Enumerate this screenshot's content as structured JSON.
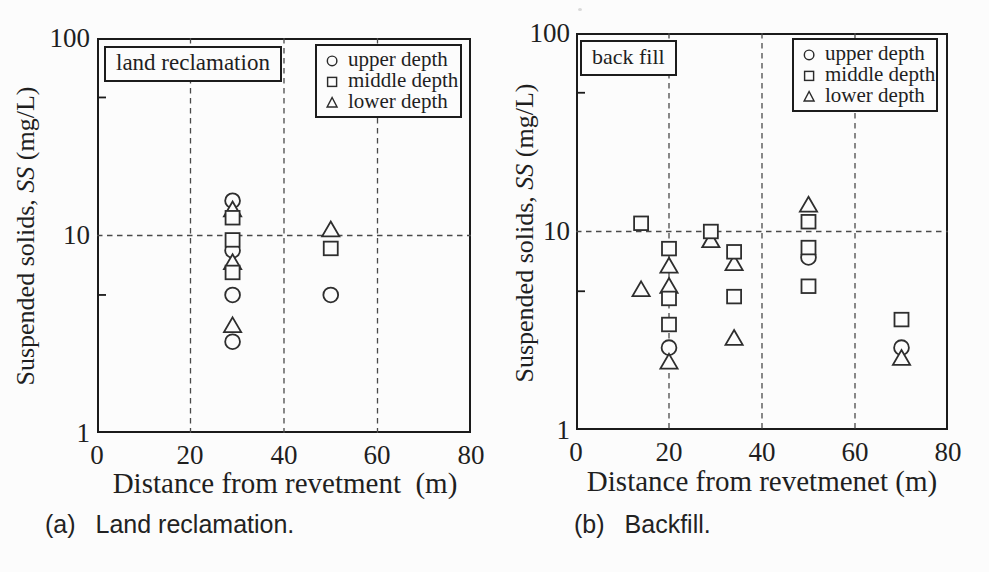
{
  "figure": {
    "ylabel_prefix": "Suspended solids, ",
    "ylabel_ss": "SS",
    "ylabel_unit": " (mg/L)"
  },
  "chart_data": [
    {
      "type": "scatter",
      "panel_label": "(a)",
      "panel_caption": "Land reclamation.",
      "title": "land reclamation",
      "xlabel": "Distance from revetment  (m)",
      "ylabel": "Suspended solids, SS (mg/L)",
      "x_axis": {
        "min": 0,
        "max": 80,
        "ticks": [
          "0",
          "20",
          "40",
          "60",
          "80"
        ],
        "tick_values": [
          0,
          20,
          40,
          60,
          80
        ]
      },
      "y_axis": {
        "scale": "log",
        "min": 1,
        "max": 100,
        "ticks": [
          "100",
          "10",
          "1"
        ],
        "tick_values": [
          100,
          10,
          1
        ],
        "minor_ticks": [
          50,
          5
        ]
      },
      "grid": {
        "x_dashed": [
          20,
          40,
          60
        ],
        "y_dashed": [
          10
        ]
      },
      "legend": [
        {
          "marker": "circle",
          "label": "upper depth"
        },
        {
          "marker": "square",
          "label": "middle depth"
        },
        {
          "marker": "triangle",
          "label": "lower depth"
        }
      ],
      "series": [
        {
          "name": "upper depth",
          "marker": "circle",
          "points": [
            [
              29,
              15.0
            ],
            [
              29,
              8.4
            ],
            [
              29,
              5.0
            ],
            [
              29,
              2.9
            ],
            [
              50,
              5.0
            ]
          ]
        },
        {
          "name": "middle depth",
          "marker": "square",
          "points": [
            [
              29,
              12.3
            ],
            [
              29,
              9.5
            ],
            [
              29,
              6.5
            ],
            [
              50,
              8.6
            ]
          ]
        },
        {
          "name": "lower depth",
          "marker": "triangle",
          "points": [
            [
              29,
              13.5
            ],
            [
              29,
              7.3
            ],
            [
              29,
              3.5
            ],
            [
              50,
              10.7
            ]
          ]
        }
      ]
    },
    {
      "type": "scatter",
      "panel_label": "(b)",
      "panel_caption": "Backfill.",
      "title": "back fill",
      "xlabel": "Distance from revetmenet (m)",
      "ylabel": "Suspended solids, SS (mg/L)",
      "x_axis": {
        "min": 0,
        "max": 80,
        "ticks": [
          "0",
          "20",
          "40",
          "60",
          "80"
        ],
        "tick_values": [
          0,
          20,
          40,
          60,
          80
        ]
      },
      "y_axis": {
        "scale": "log",
        "min": 1,
        "max": 100,
        "ticks": [
          "100",
          "10",
          "1"
        ],
        "tick_values": [
          100,
          10,
          1
        ],
        "minor_ticks": [
          50,
          5
        ]
      },
      "grid": {
        "x_dashed": [
          20,
          40,
          60
        ],
        "y_dashed": [
          10
        ]
      },
      "legend": [
        {
          "marker": "circle",
          "label": "upper depth"
        },
        {
          "marker": "square",
          "label": "middle depth"
        },
        {
          "marker": "triangle",
          "label": "lower depth"
        }
      ],
      "series": [
        {
          "name": "upper depth",
          "marker": "circle",
          "points": [
            [
              20,
              2.6
            ],
            [
              50,
              7.4
            ],
            [
              70,
              2.6
            ]
          ]
        },
        {
          "name": "middle depth",
          "marker": "square",
          "points": [
            [
              14,
              11.0
            ],
            [
              20,
              8.2
            ],
            [
              20,
              4.6
            ],
            [
              20,
              3.4
            ],
            [
              29,
              10.0
            ],
            [
              34,
              7.9
            ],
            [
              34,
              4.7
            ],
            [
              50,
              11.2
            ],
            [
              50,
              8.3
            ],
            [
              50,
              5.3
            ],
            [
              70,
              3.6
            ]
          ]
        },
        {
          "name": "lower depth",
          "marker": "triangle",
          "points": [
            [
              14,
              5.1
            ],
            [
              20,
              6.7
            ],
            [
              20,
              5.3
            ],
            [
              20,
              2.2
            ],
            [
              29,
              9.0
            ],
            [
              34,
              6.9
            ],
            [
              34,
              2.9
            ],
            [
              50,
              13.6
            ],
            [
              70,
              2.3
            ]
          ]
        }
      ]
    }
  ]
}
